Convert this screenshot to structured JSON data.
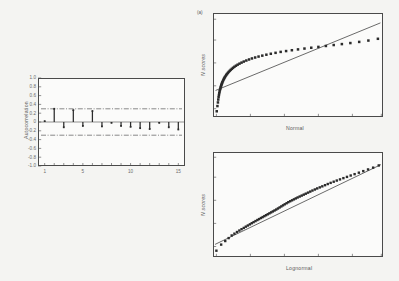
{
  "figure": {
    "background_color": "#f4f4f2",
    "ink_color": "#2b2b2b",
    "axis_color": "#4a4a4a"
  },
  "chart_data": [
    {
      "type": "bar",
      "name": "autocorrelation-function",
      "title": "",
      "xlabel": "",
      "ylabel": "Autocorrelation",
      "xlim": [
        0.3,
        15.7
      ],
      "ylim": [
        -1.0,
        1.0
      ],
      "grid": false,
      "legend": "none",
      "categories": [
        1,
        2,
        3,
        4,
        5,
        6,
        7,
        8,
        9,
        10,
        11,
        12,
        13,
        14,
        15
      ],
      "values": [
        0.02,
        0.3,
        -0.12,
        0.27,
        -0.09,
        0.25,
        -0.1,
        -0.02,
        -0.09,
        -0.11,
        -0.14,
        -0.16,
        -0.02,
        -0.12,
        -0.17
      ],
      "xticks": [
        1,
        5,
        10,
        15
      ],
      "xtick_labels": [
        "1",
        "5",
        "10",
        "15"
      ],
      "yticks": [
        -1.0,
        -0.8,
        -0.6,
        -0.4,
        -0.2,
        0.0,
        0.2,
        0.4,
        0.6,
        0.8,
        1.0
      ],
      "ytick_labels": [
        "-1.0",
        "-0.8",
        "-0.6",
        "-0.4",
        "-0.2",
        "0",
        "0.2",
        "0.4",
        "0.6",
        "0.8",
        "1.0"
      ],
      "minor_xticks": [
        1,
        2,
        3,
        4,
        5,
        6,
        7,
        8,
        9,
        10,
        11,
        12,
        13,
        14,
        15
      ],
      "confidence_bands": [
        0.3,
        -0.3
      ],
      "confidence_band_style": "dash-dot"
    },
    {
      "type": "scatter",
      "name": "normal-probability-plot",
      "tag": "(a)",
      "title": "",
      "xlabel": "Normal",
      "ylabel": "N scores",
      "xlim": [
        0,
        1
      ],
      "ylim": [
        0,
        1
      ],
      "grid": false,
      "legend": "none",
      "xtick_positions": [
        0.02,
        0.22,
        0.42,
        0.62,
        0.82,
        0.99
      ],
      "ytick_positions": [
        0.08,
        0.3,
        0.52,
        0.74,
        0.94
      ],
      "reference_line": {
        "x0": 0.015,
        "y0": 0.255,
        "x1": 0.985,
        "y1": 0.905
      },
      "points_x": [
        0.022,
        0.026,
        0.029,
        0.031,
        0.033,
        0.035,
        0.037,
        0.039,
        0.041,
        0.043,
        0.045,
        0.047,
        0.049,
        0.051,
        0.053,
        0.055,
        0.058,
        0.061,
        0.064,
        0.067,
        0.07,
        0.074,
        0.078,
        0.082,
        0.087,
        0.092,
        0.098,
        0.104,
        0.111,
        0.118,
        0.126,
        0.135,
        0.145,
        0.156,
        0.168,
        0.181,
        0.196,
        0.212,
        0.229,
        0.248,
        0.268,
        0.29,
        0.314,
        0.34,
        0.368,
        0.398,
        0.43,
        0.464,
        0.5,
        0.538,
        0.578,
        0.62,
        0.664,
        0.71,
        0.758,
        0.808,
        0.86,
        0.914,
        0.97
      ],
      "points_y": [
        0.055,
        0.105,
        0.14,
        0.168,
        0.192,
        0.212,
        0.23,
        0.246,
        0.26,
        0.273,
        0.285,
        0.296,
        0.306,
        0.316,
        0.325,
        0.334,
        0.345,
        0.356,
        0.366,
        0.375,
        0.384,
        0.394,
        0.404,
        0.413,
        0.423,
        0.433,
        0.443,
        0.453,
        0.463,
        0.473,
        0.483,
        0.493,
        0.503,
        0.513,
        0.523,
        0.533,
        0.543,
        0.553,
        0.563,
        0.572,
        0.581,
        0.59,
        0.599,
        0.608,
        0.617,
        0.626,
        0.634,
        0.642,
        0.65,
        0.658,
        0.666,
        0.674,
        0.683,
        0.692,
        0.701,
        0.711,
        0.722,
        0.735,
        0.752
      ]
    },
    {
      "type": "scatter",
      "name": "lognormal-probability-plot",
      "title": "",
      "xlabel": "Lognormal",
      "ylabel": "N scores",
      "xlim": [
        0,
        1
      ],
      "ylim": [
        0,
        1
      ],
      "grid": false,
      "legend": "none",
      "xtick_positions": [
        0.02,
        0.22,
        0.42,
        0.62,
        0.82,
        0.99
      ],
      "ytick_positions": [
        0.1,
        0.32,
        0.54,
        0.76,
        0.95
      ],
      "reference_line": {
        "x0": 0.012,
        "y0": 0.12,
        "x1": 0.988,
        "y1": 0.88
      },
      "points_x": [
        0.02,
        0.048,
        0.072,
        0.092,
        0.11,
        0.126,
        0.141,
        0.155,
        0.168,
        0.181,
        0.193,
        0.205,
        0.217,
        0.228,
        0.239,
        0.25,
        0.261,
        0.271,
        0.282,
        0.292,
        0.302,
        0.312,
        0.322,
        0.332,
        0.342,
        0.352,
        0.362,
        0.372,
        0.382,
        0.392,
        0.402,
        0.412,
        0.422,
        0.433,
        0.443,
        0.454,
        0.465,
        0.476,
        0.487,
        0.498,
        0.51,
        0.522,
        0.534,
        0.546,
        0.559,
        0.572,
        0.585,
        0.599,
        0.613,
        0.628,
        0.643,
        0.659,
        0.675,
        0.692,
        0.71,
        0.728,
        0.747,
        0.767,
        0.788,
        0.81,
        0.833,
        0.858,
        0.884,
        0.912,
        0.942,
        0.975
      ],
      "points_y": [
        0.06,
        0.118,
        0.152,
        0.18,
        0.205,
        0.222,
        0.238,
        0.252,
        0.265,
        0.277,
        0.289,
        0.3,
        0.311,
        0.322,
        0.332,
        0.342,
        0.352,
        0.361,
        0.371,
        0.38,
        0.389,
        0.398,
        0.407,
        0.416,
        0.425,
        0.434,
        0.443,
        0.452,
        0.462,
        0.472,
        0.482,
        0.492,
        0.502,
        0.512,
        0.522,
        0.531,
        0.54,
        0.549,
        0.558,
        0.567,
        0.576,
        0.585,
        0.594,
        0.603,
        0.613,
        0.623,
        0.633,
        0.643,
        0.653,
        0.663,
        0.673,
        0.684,
        0.695,
        0.706,
        0.717,
        0.728,
        0.739,
        0.751,
        0.763,
        0.776,
        0.789,
        0.803,
        0.818,
        0.834,
        0.851,
        0.872
      ]
    }
  ]
}
